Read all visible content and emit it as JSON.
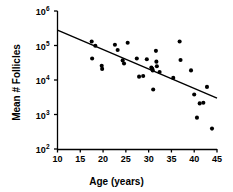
{
  "figure": {
    "background_color": "#ffffff",
    "foreground_color": "#000000"
  },
  "axes": {
    "x_title": "Age (years)",
    "y_title": "Mean # Follicles",
    "x_ticks": [
      "10",
      "15",
      "20",
      "25",
      "30",
      "35",
      "40",
      "45"
    ],
    "y_ticks": [
      {
        "base": "10",
        "exponent": "2"
      },
      {
        "base": "10",
        "exponent": "3"
      },
      {
        "base": "10",
        "exponent": "4"
      },
      {
        "base": "10",
        "exponent": "5"
      },
      {
        "base": "10",
        "exponent": "6"
      }
    ]
  },
  "chart_data": {
    "type": "scatter",
    "title": "",
    "xlabel": "Age (years)",
    "ylabel": "Mean # Follicles",
    "xlim": [
      10,
      45
    ],
    "ylim": [
      100,
      1000000
    ],
    "yscale": "log",
    "xscale": "linear",
    "grid": false,
    "legend": null,
    "points": [
      {
        "x": 17.5,
        "y": 130000
      },
      {
        "x": 17.6,
        "y": 42000
      },
      {
        "x": 18.3,
        "y": 98000
      },
      {
        "x": 19.7,
        "y": 26000
      },
      {
        "x": 19.8,
        "y": 21000
      },
      {
        "x": 22.6,
        "y": 105000
      },
      {
        "x": 23.2,
        "y": 74000
      },
      {
        "x": 24.3,
        "y": 37000
      },
      {
        "x": 24.6,
        "y": 30000
      },
      {
        "x": 25.4,
        "y": 120000
      },
      {
        "x": 27.4,
        "y": 42000
      },
      {
        "x": 27.9,
        "y": 12500
      },
      {
        "x": 28.8,
        "y": 13000
      },
      {
        "x": 29.6,
        "y": 40000
      },
      {
        "x": 30.6,
        "y": 23000
      },
      {
        "x": 30.8,
        "y": 21000
      },
      {
        "x": 30.9,
        "y": 19000
      },
      {
        "x": 31.0,
        "y": 5300
      },
      {
        "x": 31.6,
        "y": 70000
      },
      {
        "x": 31.7,
        "y": 34000
      },
      {
        "x": 31.8,
        "y": 25000
      },
      {
        "x": 32.4,
        "y": 17000
      },
      {
        "x": 35.4,
        "y": 11500
      },
      {
        "x": 36.8,
        "y": 130000
      },
      {
        "x": 37.0,
        "y": 38000
      },
      {
        "x": 39.3,
        "y": 19000
      },
      {
        "x": 40.0,
        "y": 3800
      },
      {
        "x": 40.6,
        "y": 810
      },
      {
        "x": 41.2,
        "y": 2100
      },
      {
        "x": 42.0,
        "y": 2200
      },
      {
        "x": 42.8,
        "y": 6300
      },
      {
        "x": 43.9,
        "y": 390
      }
    ],
    "trendline": {
      "type": "linear-fit-on-log",
      "x_start": 10,
      "y_start": 280000,
      "x_end": 45,
      "y_end": 3000
    }
  }
}
